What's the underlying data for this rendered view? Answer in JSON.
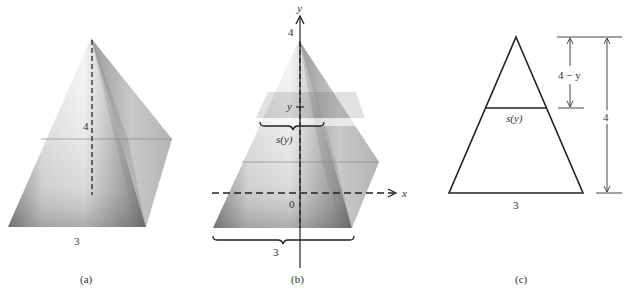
{
  "figure": {
    "panels": [
      {
        "id": "a",
        "caption": "(a)",
        "description": "Square pyramid with height 4 and base side 3",
        "height_label": "4",
        "base_label": "3"
      },
      {
        "id": "b",
        "caption": "(b)",
        "description": "Pyramid placed on coordinate axes with cross-sectional slab at height y",
        "y_axis_label": "y",
        "x_axis_label": "x",
        "apex_tick_label": "4",
        "origin_label": "0",
        "slice_tick_label": "y",
        "slice_width_label": "s(y)",
        "base_label": "3"
      },
      {
        "id": "c",
        "caption": "(c)",
        "description": "Triangular cross-section showing similar triangles",
        "slice_width_label": "s(y)",
        "base_label": "3",
        "upper_dimension_label": "4 − y",
        "total_dimension_label": "4"
      }
    ],
    "colors": {
      "line": "#222222",
      "text": "#333333",
      "shade_dark": "#6e6e6e",
      "shade_light": "#f2f2f2"
    }
  }
}
